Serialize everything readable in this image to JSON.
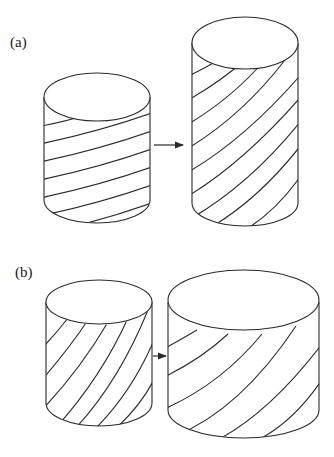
{
  "panels": [
    {
      "id": "a",
      "label": "(a)",
      "description": "Narrow cylinder with shallow helical winding lines transforms into a taller cylinder with steeper winding lines",
      "before": {
        "shape": "cylinder",
        "proportion": "medium",
        "winding_angle": "shallow",
        "stripe_count": 8
      },
      "after": {
        "shape": "cylinder",
        "proportion": "tall",
        "winding_angle": "steeper",
        "stripe_count": 10
      },
      "arrow": "right"
    },
    {
      "id": "b",
      "label": "(b)",
      "description": "Cylinder with steep helical winding lines transforms into a wider, shorter cylinder with shallower winding lines",
      "before": {
        "shape": "cylinder",
        "proportion": "medium",
        "winding_angle": "steep",
        "stripe_count": 7
      },
      "after": {
        "shape": "cylinder",
        "proportion": "wide",
        "winding_angle": "shallower",
        "stripe_count": 7
      },
      "arrow": "right"
    }
  ],
  "colors": {
    "line": "#2a2a2a",
    "background": "#ffffff"
  }
}
